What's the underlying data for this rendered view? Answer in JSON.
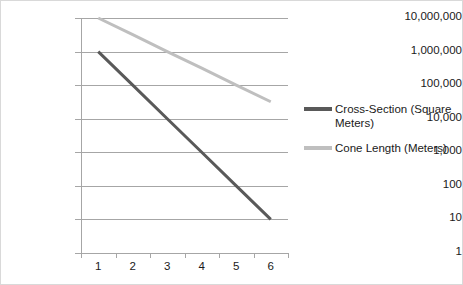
{
  "chart_data": {
    "type": "line",
    "title": "",
    "xlabel": "",
    "ylabel": "",
    "x_tick_labels": [
      "1",
      "2",
      "3",
      "4",
      "5",
      "6"
    ],
    "categories": [
      1,
      2,
      3,
      4,
      5,
      6
    ],
    "yscale": "log",
    "ylim": [
      1,
      10000000
    ],
    "y_tick_labels": [
      "10,000,000",
      "1,000,000",
      "100,000",
      "10,000",
      "1,000",
      "100",
      "10",
      "1"
    ],
    "y_tick_values": [
      10000000,
      1000000,
      100000,
      10000,
      1000,
      100,
      10,
      1
    ],
    "grid": true,
    "legend_position": "right",
    "series": [
      {
        "name": "Cross-Section (Square Meters)",
        "color": "#595959",
        "values": [
          1000000,
          100000,
          10000,
          1000,
          100,
          10
        ]
      },
      {
        "name": "Cone Length (Meters)",
        "color": "#bfbfbf",
        "values": [
          10000000,
          3200000,
          1000000,
          320000,
          100000,
          32000
        ]
      }
    ]
  },
  "legend": {
    "entries": [
      {
        "label": "Cross-Section (Square Meters)"
      },
      {
        "label": "Cone Length (Meters)"
      }
    ]
  },
  "colors": {
    "series_cross_section": "#595959",
    "series_cone_length": "#bfbfbf",
    "gridline": "#a6a6a6",
    "axis": "#a6a6a6",
    "text": "#1a1a1a",
    "frame_border": "#d9d9d9",
    "background": "#ffffff"
  }
}
